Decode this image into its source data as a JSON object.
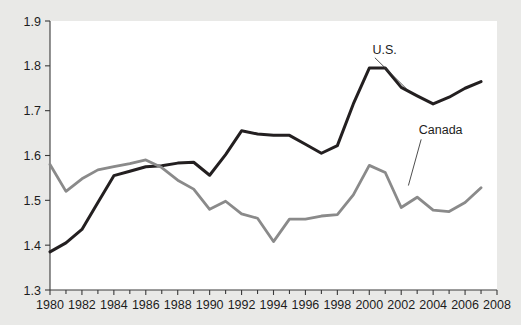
{
  "chart_data": {
    "type": "line",
    "title": "",
    "subtitle": "",
    "xlabel": "",
    "ylabel": "",
    "xlim": [
      1980,
      2008
    ],
    "ylim": [
      1.3,
      1.9
    ],
    "grid": false,
    "legend_position": "inline-annotation",
    "x": [
      1980,
      1981,
      1982,
      1983,
      1984,
      1985,
      1986,
      1987,
      1988,
      1989,
      1990,
      1991,
      1992,
      1993,
      1994,
      1995,
      1996,
      1997,
      1998,
      1999,
      2000,
      2001,
      2002,
      2003,
      2004,
      2005,
      2006,
      2007
    ],
    "x_tick_labels": [
      "1980",
      "1982",
      "1984",
      "1986",
      "1988",
      "1990",
      "1992",
      "1994",
      "1996",
      "1998",
      "2000",
      "2002",
      "2004",
      "2006",
      "2008"
    ],
    "x_tick_values": [
      1980,
      1982,
      1984,
      1986,
      1988,
      1990,
      1992,
      1994,
      1996,
      1998,
      2000,
      2002,
      2004,
      2006,
      2008
    ],
    "x_minor_tick_values": [
      1981,
      1983,
      1985,
      1987,
      1989,
      1991,
      1993,
      1995,
      1997,
      1999,
      2001,
      2003,
      2005,
      2007
    ],
    "y_tick_labels": [
      "1.3",
      "1.4",
      "1.5",
      "1.6",
      "1.7",
      "1.8",
      "1.9"
    ],
    "y_tick_values": [
      1.3,
      1.4,
      1.5,
      1.6,
      1.7,
      1.8,
      1.9
    ],
    "series": [
      {
        "name": "U.S.",
        "color": "#231f20",
        "width": 3.0,
        "values": [
          1.385,
          1.405,
          1.435,
          1.495,
          1.555,
          1.565,
          1.575,
          1.577,
          1.583,
          1.585,
          1.556,
          1.602,
          1.655,
          1.648,
          1.645,
          1.645,
          1.625,
          1.605,
          1.622,
          1.715,
          1.795,
          1.795,
          1.752,
          1.733,
          1.715,
          1.73,
          1.75,
          1.765
        ],
        "label_text": "U.S.",
        "label_x": 2000.2,
        "label_y": 1.827
      },
      {
        "name": "Canada",
        "color": "#8a8a8a",
        "width": 2.8,
        "values": [
          1.58,
          1.52,
          1.548,
          1.568,
          1.575,
          1.582,
          1.59,
          1.573,
          1.545,
          1.525,
          1.48,
          1.498,
          1.47,
          1.46,
          1.408,
          1.458,
          1.458,
          1.465,
          1.468,
          1.512,
          1.578,
          1.562,
          1.484,
          1.507,
          1.478,
          1.475,
          1.495,
          1.528
        ],
        "label_text": "Canada",
        "label_x": 2003.1,
        "label_y": 1.648
      }
    ],
    "annotations": [
      {
        "name": "us-leader-line",
        "from_x": 2000.35,
        "from_y": 1.818,
        "to_x": 2002.35,
        "to_y": 1.748
      },
      {
        "name": "canada-leader-line",
        "from_x": 2003.25,
        "from_y": 1.636,
        "to_x": 2002.45,
        "to_y": 1.533
      }
    ],
    "colors": {
      "background": "#e9e9e7",
      "plot_background": "#ffffff",
      "axis": "#3a3a3a",
      "text": "#1d1d1d",
      "us_series": "#231f20",
      "canada_series": "#8a8a8a"
    }
  }
}
